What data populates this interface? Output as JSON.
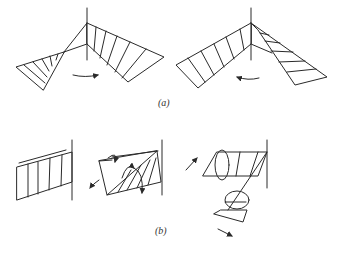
{
  "figure": {
    "part_a": {
      "label": "(a)",
      "description": "Two folded-sheet diagrams on a vertical axis with rotation arrows (left: clockwise arrow, right: counter-clockwise arrow)"
    },
    "part_b": {
      "label": "(b)",
      "description": "Three panel diagrams attached to a vertical edge, showing twisting with curved arrows"
    }
  },
  "colors": {
    "line": "#2a2a2a",
    "background": "#ffffff"
  }
}
